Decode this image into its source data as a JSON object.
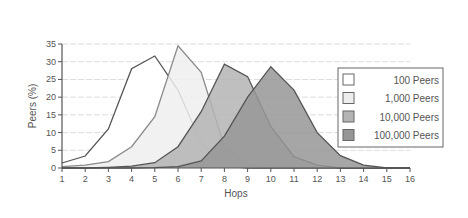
{
  "chart_data": {
    "type": "area",
    "title": "",
    "xlabel": "Hops",
    "ylabel": "Peers (%)",
    "x": [
      1,
      2,
      3,
      4,
      5,
      6,
      7,
      8,
      9,
      10,
      11,
      12,
      13,
      14,
      15,
      16
    ],
    "xlim": [
      1,
      16
    ],
    "ylim": [
      0,
      35
    ],
    "yticks": [
      0,
      5,
      10,
      15,
      20,
      25,
      30,
      35
    ],
    "xticks": [
      1,
      2,
      3,
      4,
      5,
      6,
      7,
      8,
      9,
      10,
      11,
      12,
      13,
      14,
      15,
      16
    ],
    "grid": true,
    "legend_position": "right",
    "series": [
      {
        "name": "100 Peers",
        "fill": "#ffffff",
        "line": "#555555",
        "values": [
          1.4,
          3.4,
          11,
          28,
          31.6,
          22,
          7,
          0.6,
          0,
          0,
          0,
          0,
          0,
          0,
          0,
          0
        ]
      },
      {
        "name": "1,000 Peers",
        "fill": "#eeeeee",
        "line": "#8a8a8a",
        "values": [
          0.4,
          0.8,
          1.8,
          6,
          14.5,
          34.5,
          27,
          6,
          1,
          0,
          0,
          0,
          0,
          0,
          0,
          0
        ]
      },
      {
        "name": "10,000 Peers",
        "fill": "#b4b4b4",
        "line": "#555555",
        "values": [
          0,
          0,
          0.2,
          0.5,
          1.5,
          6,
          15.9,
          29.3,
          25.8,
          11.7,
          3.2,
          0.8,
          0,
          0,
          0,
          0
        ]
      },
      {
        "name": "100,000 Peers",
        "fill": "#969696",
        "line": "#555555",
        "values": [
          0,
          0,
          0,
          0,
          0.1,
          0.4,
          2,
          9,
          20,
          28.6,
          22,
          10,
          3.5,
          0.8,
          0,
          0
        ]
      }
    ]
  }
}
